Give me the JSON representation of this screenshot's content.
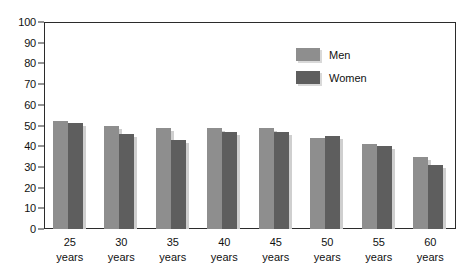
{
  "chart_data": {
    "type": "bar",
    "title": "",
    "subtitle": "",
    "xlabel": "",
    "ylabel": "",
    "categories": [
      "25\nyears",
      "30\nyears",
      "35\nyears",
      "40\nyears",
      "45\nyears",
      "50\nyears",
      "55\nyears",
      "60\nyears"
    ],
    "category_numbers": [
      "25",
      "30",
      "35",
      "40",
      "45",
      "50",
      "55",
      "60"
    ],
    "category_unit": "years",
    "series": [
      {
        "name": "Men",
        "color": "#8e8e8e",
        "values": [
          52,
          50,
          49,
          49,
          49,
          44,
          41,
          35
        ]
      },
      {
        "name": "Women",
        "color": "#5e5e5e",
        "values": [
          51,
          46,
          43,
          47,
          47,
          45,
          40,
          31
        ]
      }
    ],
    "ylim": [
      0,
      100
    ],
    "yticks": [
      0,
      10,
      20,
      30,
      40,
      50,
      60,
      70,
      80,
      90,
      100
    ],
    "ytick_labels": [
      "0",
      "10",
      "20",
      "30",
      "40",
      "50",
      "60",
      "70",
      "80",
      "90",
      "100"
    ],
    "grid": false,
    "legend_position": "upper right",
    "frame": true
  },
  "legend": {
    "entries": [
      {
        "label": "Men",
        "color": "#8e8e8e"
      },
      {
        "label": "Women",
        "color": "#5e5e5e"
      }
    ]
  },
  "colors": {
    "men": "#8e8e8e",
    "women": "#5e5e5e",
    "axis": "#2b2b2b",
    "shadow": "#d9d9d9",
    "background": "#ffffff"
  }
}
